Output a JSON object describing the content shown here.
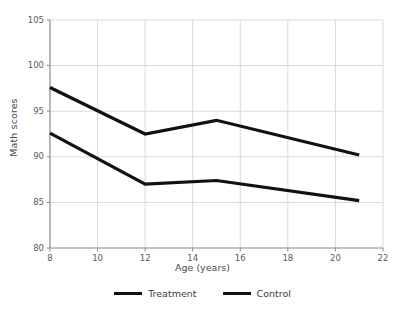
{
  "chart_data": {
    "type": "line",
    "title": "",
    "xlabel": "Age (years)",
    "ylabel": "Math scores",
    "xlim": [
      8,
      22
    ],
    "ylim": [
      80,
      105
    ],
    "xticks": [
      8,
      10,
      12,
      14,
      16,
      18,
      20,
      22
    ],
    "xtick_labels": [
      "8",
      "10",
      "12",
      "14",
      "16",
      "18",
      "20",
      "22"
    ],
    "yticks": [
      80,
      85,
      90,
      95,
      100,
      105
    ],
    "ytick_labels": [
      "80",
      "85",
      "90",
      "95",
      "100",
      "105"
    ],
    "grid": true,
    "legend_position": "bottom",
    "x": [
      8,
      12,
      15,
      21
    ],
    "series": [
      {
        "name": "Treatment",
        "color": "#111111",
        "values": [
          97.6,
          92.5,
          94.0,
          90.2
        ]
      },
      {
        "name": "Control",
        "color": "#111111",
        "values": [
          92.6,
          87.0,
          87.4,
          85.2
        ]
      }
    ]
  },
  "legend": {
    "items": [
      {
        "label": "Treatment"
      },
      {
        "label": "Control"
      }
    ]
  },
  "colors": {
    "background": "#ffffff",
    "grid": "#d9d9d9",
    "axis": "#8a8a8a",
    "line": "#111111",
    "text": "#4a4a4a"
  }
}
